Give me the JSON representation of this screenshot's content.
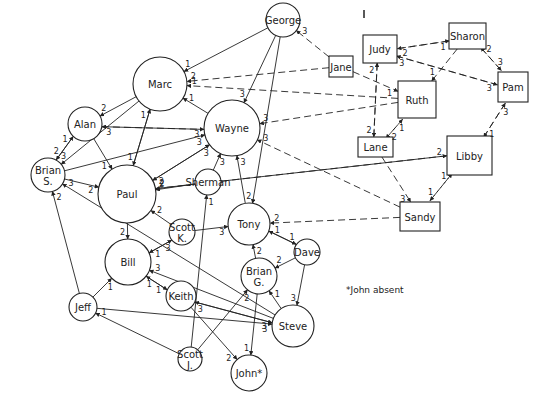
{
  "diagram": {
    "type": "sociogram",
    "footnote": "*John absent",
    "circle_nodes": [
      {
        "id": "george",
        "label": "George",
        "cx": 283,
        "cy": 20,
        "r": 17
      },
      {
        "id": "marc",
        "label": "Marc",
        "cx": 160,
        "cy": 84,
        "r": 27
      },
      {
        "id": "alan",
        "label": "Alan",
        "cx": 85,
        "cy": 124,
        "r": 17
      },
      {
        "id": "wayne",
        "label": "Wayne",
        "cx": 232,
        "cy": 128,
        "r": 28
      },
      {
        "id": "brian_s",
        "label": "Brian",
        "label2": "S.",
        "cx": 48,
        "cy": 175,
        "r": 17
      },
      {
        "id": "paul",
        "label": "Paul",
        "cx": 127,
        "cy": 194,
        "r": 29
      },
      {
        "id": "sherman",
        "label": "Sherman",
        "cx": 208,
        "cy": 182,
        "r": 13
      },
      {
        "id": "tony",
        "label": "Tony",
        "cx": 249,
        "cy": 224,
        "r": 21
      },
      {
        "id": "scott_k",
        "label": "Scott",
        "label2": "K.",
        "cx": 182,
        "cy": 232,
        "r": 13
      },
      {
        "id": "bill",
        "label": "Bill",
        "cx": 128,
        "cy": 262,
        "r": 23
      },
      {
        "id": "dave",
        "label": "Dave",
        "cx": 307,
        "cy": 252,
        "r": 13
      },
      {
        "id": "brian_g",
        "label": "Brian",
        "label2": "G.",
        "cx": 259,
        "cy": 276,
        "r": 18
      },
      {
        "id": "keith",
        "label": "Keith",
        "cx": 181,
        "cy": 296,
        "r": 15
      },
      {
        "id": "jeff",
        "label": "Jeff",
        "cx": 83,
        "cy": 307,
        "r": 14
      },
      {
        "id": "steve",
        "label": "Steve",
        "cx": 293,
        "cy": 326,
        "r": 21
      },
      {
        "id": "scott_j",
        "label": "Scott",
        "label2": "J.",
        "cx": 190,
        "cy": 359,
        "r": 12
      },
      {
        "id": "john",
        "label": "John*",
        "cx": 249,
        "cy": 373,
        "r": 18
      }
    ],
    "rect_nodes": [
      {
        "id": "judy",
        "label": "Judy",
        "x": 363,
        "y": 35,
        "w": 34,
        "h": 28
      },
      {
        "id": "jane",
        "label": "Jane",
        "x": 329,
        "y": 56,
        "w": 24,
        "h": 21
      },
      {
        "id": "sharon",
        "label": "Sharon",
        "x": 449,
        "y": 23,
        "w": 37,
        "h": 26
      },
      {
        "id": "ruth",
        "label": "Ruth",
        "x": 398,
        "y": 81,
        "w": 38,
        "h": 37
      },
      {
        "id": "pam",
        "label": "Pam",
        "x": 498,
        "y": 72,
        "w": 30,
        "h": 30
      },
      {
        "id": "lane",
        "label": "Lane",
        "x": 358,
        "y": 137,
        "w": 35,
        "h": 20
      },
      {
        "id": "libby",
        "label": "Libby",
        "x": 447,
        "y": 136,
        "w": 45,
        "h": 39
      },
      {
        "id": "sandy",
        "label": "Sandy",
        "x": 400,
        "y": 202,
        "w": 40,
        "h": 29
      }
    ],
    "edges": [
      {
        "from": "george",
        "to": "marc",
        "w": "1",
        "style": "solid"
      },
      {
        "from": "jane",
        "to": "marc",
        "w": "2",
        "style": "dash"
      },
      {
        "from": "ruth",
        "to": "marc",
        "w": "1",
        "style": "dash"
      },
      {
        "from": "wayne",
        "to": "marc",
        "w": "1",
        "style": "solid"
      },
      {
        "from": "marc",
        "to": "alan",
        "w": "2",
        "style": "solid"
      },
      {
        "from": "marc",
        "to": "paul",
        "w": "1",
        "style": "solid"
      },
      {
        "from": "paul",
        "to": "marc",
        "w": "1",
        "style": "solid"
      },
      {
        "from": "marc",
        "to": "brian_s",
        "w": "3",
        "style": "solid"
      },
      {
        "from": "alan",
        "to": "wayne",
        "w": "3",
        "style": "dash"
      },
      {
        "from": "wayne",
        "to": "alan",
        "w": "3",
        "style": "solid"
      },
      {
        "from": "alan",
        "to": "brian_s",
        "w": "2",
        "style": "solid"
      },
      {
        "from": "brian_s",
        "to": "alan",
        "w": "1",
        "style": "solid"
      },
      {
        "from": "alan",
        "to": "paul",
        "w": "1",
        "style": "solid"
      },
      {
        "from": "brian_s",
        "to": "wayne",
        "w": "3",
        "style": "solid"
      },
      {
        "from": "brian_s",
        "to": "paul",
        "w": "2",
        "style": "solid"
      },
      {
        "from": "paul",
        "to": "wayne",
        "w": "3",
        "style": "solid"
      },
      {
        "from": "wayne",
        "to": "paul",
        "w": "2",
        "style": "solid"
      },
      {
        "from": "george",
        "to": "wayne",
        "w": "3",
        "style": "solid"
      },
      {
        "from": "george",
        "to": "tony",
        "w": "2",
        "style": "solid"
      },
      {
        "from": "jane",
        "to": "george",
        "w": "3",
        "style": "dash"
      },
      {
        "from": "ruth",
        "to": "wayne",
        "w": "3",
        "style": "dash"
      },
      {
        "from": "sandy",
        "to": "wayne",
        "w": "3",
        "style": "dash"
      },
      {
        "from": "sherman",
        "to": "wayne",
        "w": "3",
        "style": "solid"
      },
      {
        "from": "tony",
        "to": "wayne",
        "w": "3",
        "style": "solid"
      },
      {
        "from": "sherman",
        "to": "paul",
        "w": "2",
        "style": "solid"
      },
      {
        "from": "libby",
        "to": "paul",
        "w": "2",
        "style": "dash"
      },
      {
        "from": "sandy",
        "to": "tony",
        "w": "2",
        "style": "dash"
      },
      {
        "from": "paul",
        "to": "bill",
        "w": "2",
        "style": "solid"
      },
      {
        "from": "scott_k",
        "to": "paul",
        "w": "2",
        "style": "solid"
      },
      {
        "from": "scott_k",
        "to": "tony",
        "w": "3",
        "style": "solid"
      },
      {
        "from": "bill",
        "to": "scott_k",
        "w": "3",
        "style": "solid"
      },
      {
        "from": "scott_k",
        "to": "bill",
        "w": "1",
        "style": "solid"
      },
      {
        "from": "steve",
        "to": "bill",
        "w": "3",
        "style": "solid"
      },
      {
        "from": "bill",
        "to": "keith",
        "w": "1",
        "style": "solid"
      },
      {
        "from": "keith",
        "to": "bill",
        "w": "1",
        "style": "solid"
      },
      {
        "from": "jeff",
        "to": "bill",
        "w": "1",
        "style": "solid"
      },
      {
        "from": "jeff",
        "to": "brian_s",
        "w": "2",
        "style": "solid"
      },
      {
        "from": "steve",
        "to": "brian_s",
        "w": "3",
        "style": "solid"
      },
      {
        "from": "tony",
        "to": "dave",
        "w": "1",
        "style": "solid"
      },
      {
        "from": "dave",
        "to": "tony",
        "w": "1",
        "style": "solid"
      },
      {
        "from": "brian_g",
        "to": "tony",
        "w": "2",
        "style": "solid"
      },
      {
        "from": "dave",
        "to": "brian_g",
        "w": "2",
        "style": "solid"
      },
      {
        "from": "dave",
        "to": "steve",
        "w": "3",
        "style": "solid"
      },
      {
        "from": "steve",
        "to": "brian_g",
        "w": "1",
        "style": "solid"
      },
      {
        "from": "brian_g",
        "to": "john",
        "w": "1",
        "style": "solid"
      },
      {
        "from": "keith",
        "to": "steve",
        "w": "3",
        "style": "solid"
      },
      {
        "from": "steve",
        "to": "keith",
        "w": "3",
        "style": "solid"
      },
      {
        "from": "jeff",
        "to": "steve",
        "w": "3",
        "style": "solid"
      },
      {
        "from": "scott_j",
        "to": "jeff",
        "w": "1",
        "style": "solid"
      },
      {
        "from": "scott_j",
        "to": "brian_g",
        "w": "2",
        "style": "solid"
      },
      {
        "from": "scott_j",
        "to": "sherman",
        "w": "1",
        "style": "solid"
      },
      {
        "from": "keith",
        "to": "john",
        "w": "2",
        "style": "solid"
      },
      {
        "from": "judy",
        "to": "sharon",
        "w": "1",
        "style": "dash"
      },
      {
        "from": "sharon",
        "to": "judy",
        "w": "2",
        "style": "dash"
      },
      {
        "from": "judy",
        "to": "pam",
        "w": "3",
        "style": "dash"
      },
      {
        "from": "pam",
        "to": "judy",
        "w": "3",
        "style": "dash"
      },
      {
        "from": "sharon",
        "to": "pam",
        "w": "3",
        "style": "dash"
      },
      {
        "from": "pam",
        "to": "sharon",
        "w": "2",
        "style": "dash"
      },
      {
        "from": "sharon",
        "to": "ruth",
        "w": "1",
        "style": "dash"
      },
      {
        "from": "jane",
        "to": "ruth",
        "w": "1",
        "style": "dash"
      },
      {
        "from": "judy",
        "to": "lane",
        "w": "2",
        "style": "dash"
      },
      {
        "from": "lane",
        "to": "judy",
        "w": "2",
        "style": "dash"
      },
      {
        "from": "lane",
        "to": "ruth",
        "w": "1",
        "style": "dash"
      },
      {
        "from": "ruth",
        "to": "lane",
        "w": "2",
        "style": "dash"
      },
      {
        "from": "lane",
        "to": "sandy",
        "w": "3",
        "style": "dash"
      },
      {
        "from": "libby",
        "to": "pam",
        "w": "3",
        "style": "dash"
      },
      {
        "from": "pam",
        "to": "libby",
        "w": "1",
        "style": "dash"
      },
      {
        "from": "sandy",
        "to": "libby",
        "w": "1",
        "style": "dash"
      },
      {
        "from": "libby",
        "to": "sandy",
        "w": "1",
        "style": "dash"
      },
      {
        "from": "paul",
        "to": "libby",
        "w": "2",
        "style": "solid"
      }
    ]
  }
}
